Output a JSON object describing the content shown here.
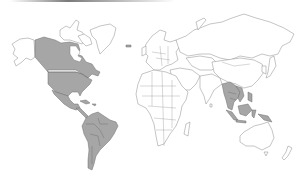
{
  "map": {
    "type": "world-choropleth",
    "projection": "equirectangular-like",
    "colors": {
      "highlight": "#a6a6a6",
      "land": "#ffffff",
      "border": "#8a8a8a",
      "top_bar_start": "#ffffff",
      "top_bar_end": "#7a7a7a"
    },
    "highlighted_regions": [
      "Canada",
      "United States",
      "Mexico",
      "Central America",
      "Caribbean",
      "Colombia",
      "Venezuela",
      "Ecuador",
      "Peru",
      "Brazil",
      "Bolivia",
      "Paraguay",
      "Chile",
      "Argentina",
      "Uruguay",
      "Guyana",
      "Suriname",
      "Iceland",
      "Myanmar",
      "Thailand",
      "Laos",
      "Cambodia",
      "Vietnam",
      "Malaysia",
      "Indonesia",
      "Philippines",
      "Papua New Guinea"
    ],
    "unhighlighted_regions": [
      "Alaska",
      "Greenland",
      "Europe",
      "Russia",
      "Africa",
      "Middle East",
      "Central Asia",
      "India",
      "China",
      "Mongolia",
      "Japan",
      "Australia",
      "New Zealand",
      "Madagascar"
    ]
  }
}
